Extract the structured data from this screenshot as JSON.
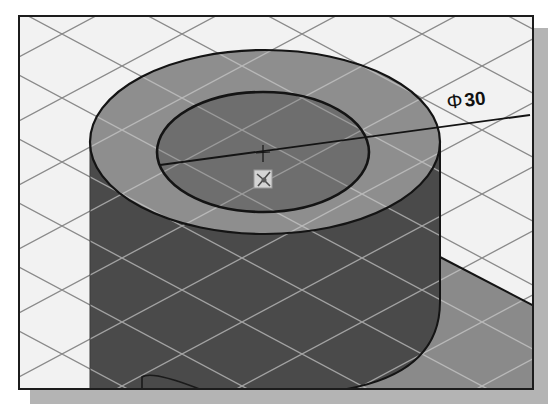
{
  "viewport": {
    "type": "3d-cad-viewport",
    "render_mode": "shaded-with-edges",
    "grid": {
      "visible": true,
      "style": "isometric",
      "line_color": "#8a8a8a"
    },
    "background_color": "#f2f2f2",
    "border_color": "#1c1c1c",
    "shadow_color": "#b4b4b4"
  },
  "model": {
    "feature": "cylinder",
    "top_face_color": "#8e8e8e",
    "side_color": "#4a4a4a",
    "inner_circle_color": "#6e6e6e",
    "base_plate_color": "#8a8a8a",
    "edge_color": "#141414"
  },
  "dimension": {
    "type": "diameter",
    "symbol": "Φ",
    "value": "30",
    "label": "Φ30"
  },
  "markers": {
    "center_mark": "cross-hair-icon",
    "origin_marker": "origin-triad-icon"
  }
}
